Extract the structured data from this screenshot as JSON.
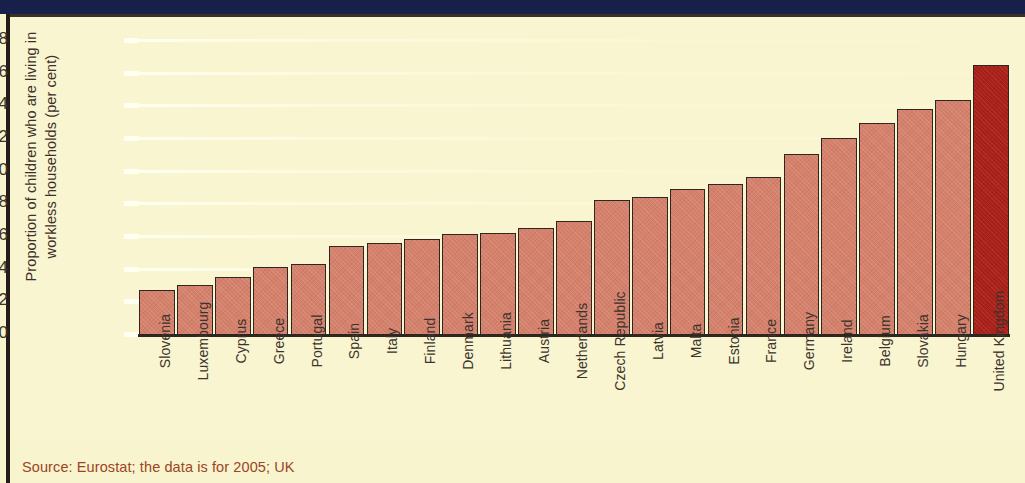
{
  "chart_data": {
    "type": "bar",
    "title": "",
    "xlabel": "",
    "ylabel": "Proportion of children who are living in\nworkless households (per cent)",
    "ylim": [
      0,
      18
    ],
    "ytick_step": 2,
    "yticks": [
      "18",
      "16",
      "14",
      "12",
      "10",
      "8",
      "6",
      "4",
      "2",
      "0"
    ],
    "grid": true,
    "legend": "none",
    "categories": [
      "Slovenia",
      "Luxembourg",
      "Cyprus",
      "Greece",
      "Portugal",
      "Spain",
      "Italy",
      "Finland",
      "Denmark",
      "Lithuania",
      "Austria",
      "Netherlands",
      "Czech Republic",
      "Latvia",
      "Malta",
      "Estonia",
      "France",
      "Germany",
      "Ireland",
      "Belgium",
      "Slovakia",
      "Hungary",
      "United Kingdom"
    ],
    "values": [
      2.7,
      3.0,
      3.5,
      4.1,
      4.3,
      5.4,
      5.6,
      5.8,
      6.1,
      6.2,
      6.5,
      6.9,
      8.2,
      8.4,
      8.9,
      9.2,
      9.6,
      11.0,
      12.0,
      12.9,
      13.8,
      14.3,
      16.5
    ],
    "highlight_category": "United Kingdom",
    "bar_color": "#d4806b",
    "highlight_color": "#ab2119",
    "bar_border_color": "#2e2620",
    "background_color": "#f9f5d0"
  },
  "yaxis_label_lines": [
    "Proportion of children who are living in",
    "workless households (per cent)"
  ],
  "source": {
    "text": "Source: Eurostat; the data is for 2005; UK",
    "color": "#9c4526"
  }
}
